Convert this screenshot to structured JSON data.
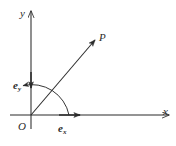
{
  "figure": {
    "background_color": "#ffffff",
    "stroke_color": "#2b2b2b"
  },
  "labels": {
    "y_axis": "y",
    "x_axis": "x",
    "origin": "O",
    "point_p": "P",
    "unit_vector_y_base": "e",
    "unit_vector_y_sub": "y",
    "unit_vector_x_base": "e",
    "unit_vector_x_sub": "x"
  },
  "geometry": {
    "origin": {
      "x": 31,
      "y": 115
    },
    "x_axis": {
      "start_x": 10,
      "end_x": 172,
      "y": 115
    },
    "y_axis": {
      "x": 31,
      "start_y": 128,
      "end_y": 8
    },
    "ray_to_p": {
      "from_x": 31,
      "from_y": 115,
      "to_x": 97,
      "to_y": 38
    },
    "unit_vector_x": {
      "from_x": 31,
      "from_y": 115,
      "to_x": 84,
      "to_y": 115
    },
    "unit_vector_y": {
      "from_x": 31,
      "from_y": 58,
      "to_x": 31,
      "to_y": 92
    },
    "angle_arc": {
      "radius": 38,
      "start_deg": 0,
      "end_deg": 78
    }
  }
}
